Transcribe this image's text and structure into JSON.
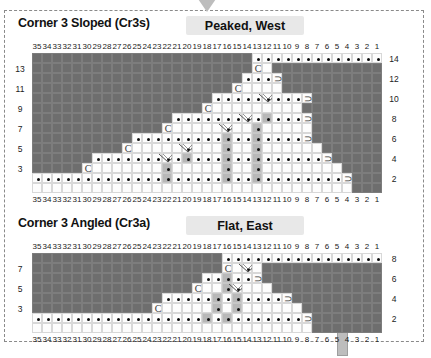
{
  "meta": {
    "width": 431,
    "height": 358,
    "colors": {
      "dark_cell": "#6e6e6e",
      "white_cell": "#fdfdfd",
      "gray_cell": "#b8b8b8",
      "chip_bg": "#e8e8e8",
      "pointer": "#bdbdbd",
      "frame": "#8a8a8a"
    }
  },
  "panels": [
    {
      "id": "cr3s",
      "title": "Corner 3 Sloped (Cr3s)",
      "chip": "Peaked, West",
      "top_ruler": [
        "35",
        "34",
        "33",
        "32",
        "31",
        "30",
        "29",
        "28",
        "27",
        "26",
        "25",
        "24",
        "23",
        "22",
        "21",
        "20",
        "19",
        "18",
        "17",
        "16",
        "15",
        "14",
        "13",
        "12",
        "11",
        "10",
        "9",
        "8",
        "7",
        "6",
        "5",
        "4",
        "3",
        "2",
        "1"
      ],
      "bottom_ruler": [
        "35",
        "34",
        "33",
        "32",
        "31",
        "30",
        "29",
        "28",
        "27",
        "26",
        "25",
        "24",
        "23",
        "22",
        "21",
        "20",
        "19",
        "18",
        "17",
        "16",
        "15",
        "14",
        "13",
        "12",
        "11",
        "10",
        "9",
        "8",
        "7",
        "6",
        "5",
        "4",
        "3",
        "2",
        "1"
      ],
      "left_labels": [
        "13",
        "11",
        "9",
        "7",
        "5",
        "3"
      ],
      "right_labels": [
        "14",
        "12",
        "10",
        "8",
        "6",
        "4",
        "2"
      ],
      "rows": 14,
      "cols": 35
    },
    {
      "id": "cr3a",
      "title": "Corner 3 Angled (Cr3a)",
      "chip": "Flat, East",
      "top_ruler": [
        "35",
        "34",
        "33",
        "32",
        "31",
        "30",
        "29",
        "28",
        "27",
        "26",
        "25",
        "24",
        "23",
        "22",
        "21",
        "20",
        "19",
        "18",
        "17",
        "16",
        "15",
        "14",
        "13",
        "12",
        "11",
        "10",
        "9",
        "8",
        "7",
        "6",
        "5",
        "4",
        "3",
        "2",
        "1"
      ],
      "bottom_ruler": [
        "35",
        "34",
        "33",
        "32",
        "31",
        "30",
        "29",
        "28",
        "27",
        "26",
        "25",
        "24",
        "23",
        "22",
        "21",
        "20",
        "19",
        "18",
        "17",
        "16",
        "15",
        "14",
        "13",
        "12",
        "11",
        "10",
        "9",
        "8",
        "7",
        "6",
        "5",
        "4",
        "3",
        "2",
        "1"
      ],
      "left_labels": [
        "7",
        "5",
        "3"
      ],
      "right_labels": [
        "8",
        "6",
        "4",
        "2"
      ],
      "rows": 8,
      "cols": 35
    }
  ],
  "grid_legend": {
    "dot": "black-dot-cell",
    "c_glyph": "C",
    "d_glyph": "⊃",
    "v_glyph": "v-arrow-mark"
  },
  "chart_data": {
    "type": "heatmap",
    "xlabel": "",
    "ylabel": "",
    "note": "Cell codes: D=dark filler, W=white dot cell, G=gray column cell, C=C glyph cell, O=reverse-C glyph cell, V=white dot cell with v arrow, B=blank white cell",
    "cr3s": {
      "row14": "DDDDDDDDDDDDDDDDDDDDDDWWWWWWWWWWWWW",
      "row13": "DDDDDDDDDDDDDDDDDDDDDDCBDDDDDDDDDDD",
      "row12": "DDDDDDDDDDDDDDDDDDDDDWWWODDDDDDDDDD",
      "row11": "DDDDDDDDDDDDDDDDDDDDCBBBBDDDDDDDDDD",
      "row10": "DDDDDDDDDDDDDDDDDDWWWWWVWWWODDDDDDD",
      "row9": "DDDDDDDDDDDDDDDDDCBBBBBBBBBDDDDDDDD",
      "row8": "DDDDDDDDDDDDDDWWWWWWWVWGWWWODDDDDDD",
      "row7": "DDDDDDDDDDDDDCBBBBBVBBGBBBBBDDDDDDD",
      "row6": "DDDDDDDDDDWWWWWWWWWGWWGWWWWODDDDDDD",
      "row5": "DDDDDDDDDCBBBBBVBBBGBBGBBBBBBDDDDDD",
      "row4": "DDDDDDWWWWWWWVWGWWWGWWGWWWWWWODDDDD",
      "row3": "DDDDDCBBBBBBBGBBBBBGBBGBBBBBBBBDDDD",
      "row2": "WWWWWWWWWWWWWGWWWWWGWWGWWWWWWWWODDD",
      "row1": "BBBBBBBBBBBBBBBBBBBBBBBBBBBBBBBBDDD"
    },
    "cr3a": {
      "row8": "DDDDDDDDDDDDDDDDDDDWWWWWWWWWWWWWWWW",
      "row7": "DDDDDDDDDDDDDDDDDDDCBVBDDDDDDDDDDDD",
      "row6": "DDDDDDDDDDDDDDDDDWWGWWODDDDDDDDDDDD",
      "row5": "DDDDDDDDDDDDDDDDCBBGVBBBDDDDDDDDDDD",
      "row4": "DDDDDDDDDDDDDWWWWWGWGWWWWODDDDDDDDD",
      "row3": "DDDDDDDDDDDDCBBBBBGBGBBBBBBDDDDDDDD",
      "row2": "WWWWWWWWWWWWWWWWWGWGWWWWWWWODDDDDDD",
      "row1": "BBBBBBBBBBBBBBBBBBBBBBBBBBBBDDDDDDD"
    }
  }
}
